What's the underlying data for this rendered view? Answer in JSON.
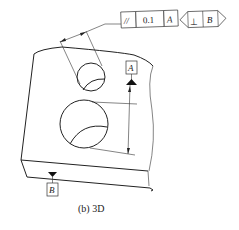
{
  "figure": {
    "caption": "(b) 3D",
    "view": "3D isometric part with two bores"
  },
  "feature_control_frames": [
    {
      "characteristic_symbol": "//",
      "characteristic": "parallelism",
      "tolerance": "0.1",
      "datum": "A"
    },
    {
      "characteristic_symbol": "⊥",
      "characteristic": "perpendicularity",
      "datum": "B"
    }
  ],
  "datums": [
    {
      "label": "A"
    },
    {
      "label": "B"
    }
  ],
  "colors": {
    "line": "#222222",
    "background": "#ffffff"
  }
}
